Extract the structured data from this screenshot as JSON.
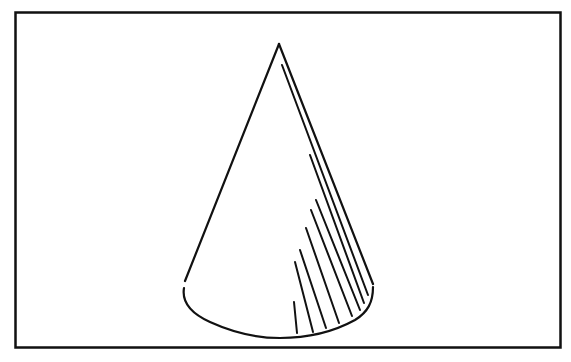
{
  "figure": {
    "stroke_color": "#111111",
    "background_color": "#ffffff",
    "frame": {
      "x": 15,
      "y": 12,
      "width": 546,
      "height": 336
    },
    "apex": {
      "x": 279,
      "y": 43
    },
    "base": {
      "left_x": 184,
      "right_x": 373,
      "y": 262,
      "bottom_y": 310
    },
    "hatch_line_count": 9
  }
}
